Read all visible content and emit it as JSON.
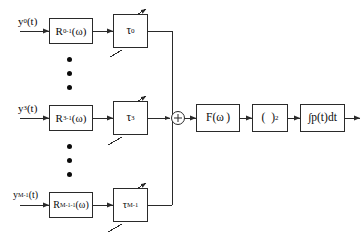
{
  "diagram": {
    "stroke_color": "#2a2a2a",
    "background_color": "#ffffff",
    "channels": [
      {
        "id": "channel-0",
        "input_label_html": "y<sub>0</sub>(t)",
        "input_label_text": "y0(t)",
        "filter_label_html": "R<sub>0</sub><sup>-1</sup>(ω)",
        "filter_label_text": "R0^-1(w)",
        "delay_label_html": "τ<sub>0</sub>",
        "delay_label_text": "tau_0"
      },
      {
        "id": "channel-3",
        "input_label_html": "y<sub>3</sub>(t)",
        "input_label_text": "y3(t)",
        "filter_label_html": "R<sub>3</sub><sup>-1</sup>(ω)",
        "filter_label_text": "R3^-1(w)",
        "delay_label_html": "τ<sub>3</sub>",
        "delay_label_text": "tau_3"
      },
      {
        "id": "channel-m-1",
        "input_label_html": "y<sub>M-1</sub>(t)",
        "input_label_text": "yM-1(t)",
        "filter_label_html": "R<sub>M-1</sub><sup>-1</sup>(ω)",
        "filter_label_text": "RM-1^-1(w)",
        "delay_label_html": "τ<sub>M-1</sub>",
        "delay_label_text": "tau_M-1"
      }
    ],
    "ellipsis": {
      "glyph": "•",
      "count": 3,
      "meaning": "additional channels omitted"
    },
    "summing_junction": {
      "symbol": "+",
      "name": "summer"
    },
    "post_blocks": [
      {
        "id": "frequency-filter",
        "label_html": "F(ω )",
        "label_text": "F(w)"
      },
      {
        "id": "square-law",
        "label_html": "(&nbsp;&nbsp;)<sup>2</sup>",
        "label_text": "( )^2"
      },
      {
        "id": "integrator",
        "label_html": "∫p(t)dt",
        "label_text": "integral p(t) dt"
      }
    ],
    "output": {
      "label": "",
      "name": "output-signal"
    }
  }
}
